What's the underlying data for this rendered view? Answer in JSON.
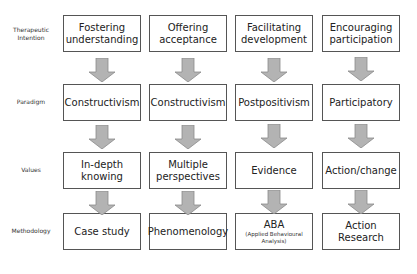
{
  "row_labels": {
    "r0": "Therapeutic Intention",
    "r0a": "Therapeutic",
    "r0b": "Intention",
    "r1": "Paradigm",
    "r2": "Values",
    "r3": "Methodology"
  },
  "columns": [
    {
      "intention": [
        "Fostering",
        "understanding"
      ],
      "paradigm": "Constructivism",
      "values": [
        "In-depth",
        "knowing"
      ],
      "methodology": [
        "Case study"
      ]
    },
    {
      "intention": [
        "Offering",
        "acceptance"
      ],
      "paradigm": "Constructivism",
      "values": [
        "Multiple",
        "perspectives"
      ],
      "methodology": [
        "Phenomenology"
      ]
    },
    {
      "intention": [
        "Facilitating",
        "development"
      ],
      "paradigm": "Postpositivism",
      "values": [
        "Evidence"
      ],
      "methodology": [
        "ABA"
      ],
      "methodology_sub": [
        "(Applied Behavioural",
        "Analysis)"
      ]
    },
    {
      "intention": [
        "Encouraging",
        "participation"
      ],
      "paradigm": "Participatory",
      "values": [
        "Action/change"
      ],
      "methodology": [
        "Action",
        "Research"
      ]
    }
  ],
  "colors": {
    "box_border": "#555555",
    "arrow_fill": "#b3b3b3",
    "arrow_stroke": "#8a8a8a"
  }
}
